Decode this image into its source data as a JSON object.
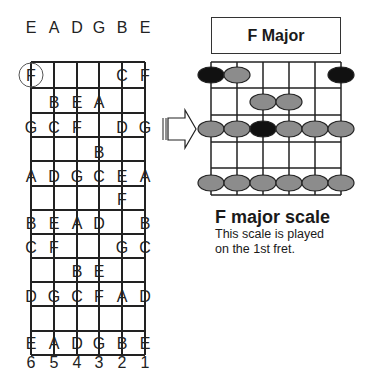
{
  "left_fretboard": {
    "open_strings": [
      "E",
      "A",
      "D",
      "G",
      "B",
      "E"
    ],
    "string_numbers": [
      "6",
      "5",
      "4",
      "3",
      "2",
      "1"
    ],
    "highlighted_note": "F",
    "rows": [
      {
        "y": 75,
        "notes": [
          {
            "s": 0,
            "n": "F"
          },
          {
            "s": 4,
            "n": "C"
          },
          {
            "s": 5,
            "n": "F"
          }
        ]
      },
      {
        "y": 102,
        "notes": [
          {
            "s": 1,
            "n": "B"
          },
          {
            "s": 2,
            "n": "E"
          },
          {
            "s": 3,
            "n": "A"
          }
        ]
      },
      {
        "y": 127,
        "notes": [
          {
            "s": 0,
            "n": "G"
          },
          {
            "s": 1,
            "n": "C"
          },
          {
            "s": 2,
            "n": "F"
          },
          {
            "s": 4,
            "n": "D"
          },
          {
            "s": 5,
            "n": "G"
          }
        ]
      },
      {
        "y": 152,
        "notes": [
          {
            "s": 3,
            "n": "B"
          }
        ]
      },
      {
        "y": 176,
        "notes": [
          {
            "s": 0,
            "n": "A"
          },
          {
            "s": 1,
            "n": "D"
          },
          {
            "s": 2,
            "n": "G"
          },
          {
            "s": 3,
            "n": "C"
          },
          {
            "s": 4,
            "n": "E"
          },
          {
            "s": 5,
            "n": "A"
          }
        ]
      },
      {
        "y": 199,
        "notes": [
          {
            "s": 4,
            "n": "F"
          }
        ]
      },
      {
        "y": 223,
        "notes": [
          {
            "s": 0,
            "n": "B"
          },
          {
            "s": 1,
            "n": "E"
          },
          {
            "s": 2,
            "n": "A"
          },
          {
            "s": 3,
            "n": "D"
          },
          {
            "s": 5,
            "n": "B"
          }
        ]
      },
      {
        "y": 247,
        "notes": [
          {
            "s": 0,
            "n": "C"
          },
          {
            "s": 1,
            "n": "F"
          },
          {
            "s": 4,
            "n": "G"
          },
          {
            "s": 5,
            "n": "C"
          }
        ]
      },
      {
        "y": 271,
        "notes": [
          {
            "s": 2,
            "n": "B"
          },
          {
            "s": 3,
            "n": "E"
          }
        ]
      },
      {
        "y": 296,
        "notes": [
          {
            "s": 0,
            "n": "D"
          },
          {
            "s": 1,
            "n": "G"
          },
          {
            "s": 2,
            "n": "C"
          },
          {
            "s": 3,
            "n": "F"
          },
          {
            "s": 4,
            "n": "A"
          },
          {
            "s": 5,
            "n": "D"
          }
        ]
      },
      {
        "y": 343,
        "notes": [
          {
            "s": 0,
            "n": "E"
          },
          {
            "s": 1,
            "n": "A"
          },
          {
            "s": 2,
            "n": "D"
          },
          {
            "s": 3,
            "n": "G"
          },
          {
            "s": 4,
            "n": "B"
          },
          {
            "s": 5,
            "n": "E"
          }
        ]
      }
    ]
  },
  "right_diagram": {
    "title": "F Major",
    "dots": [
      {
        "fret": 1,
        "s": 0,
        "root": true
      },
      {
        "fret": 1,
        "s": 1,
        "root": false
      },
      {
        "fret": 1,
        "s": 5,
        "root": true
      },
      {
        "fret": 2,
        "s": 2,
        "root": false
      },
      {
        "fret": 2,
        "s": 3,
        "root": false
      },
      {
        "fret": 3,
        "s": 0,
        "root": false
      },
      {
        "fret": 3,
        "s": 1,
        "root": false
      },
      {
        "fret": 3,
        "s": 2,
        "root": true
      },
      {
        "fret": 3,
        "s": 3,
        "root": false
      },
      {
        "fret": 3,
        "s": 4,
        "root": false
      },
      {
        "fret": 3,
        "s": 5,
        "root": false
      },
      {
        "fret": 5,
        "s": 0,
        "root": false
      },
      {
        "fret": 5,
        "s": 1,
        "root": false
      },
      {
        "fret": 5,
        "s": 2,
        "root": false
      },
      {
        "fret": 5,
        "s": 3,
        "root": false
      },
      {
        "fret": 5,
        "s": 4,
        "root": false
      },
      {
        "fret": 5,
        "s": 5,
        "root": false
      }
    ],
    "colors": {
      "root": "#111111",
      "note": "#8c8c8c"
    }
  },
  "caption": {
    "heading": "F major scale",
    "line1": "This scale is played",
    "line2": "on the 1st fret."
  }
}
